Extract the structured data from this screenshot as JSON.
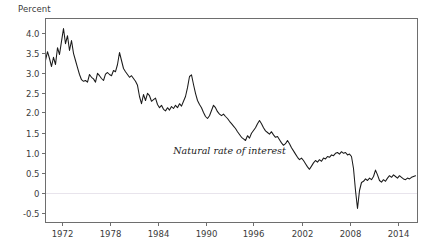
{
  "chart_data": {
    "type": "line",
    "title": "",
    "subtitle": "",
    "ylabel": "Percent",
    "xlabel": "",
    "grid": false,
    "legend": "none",
    "zero_line": true,
    "xlim": [
      1970.0,
      2016.5
    ],
    "ylim": [
      -0.75,
      4.35
    ],
    "ytick_labels": [
      "4.0",
      "3.5",
      "3.0",
      "2.5",
      "2.0",
      "1.5",
      "1.0",
      "0.5",
      "0",
      "-0.5"
    ],
    "ytick_values": [
      4.0,
      3.5,
      3.0,
      2.5,
      2.0,
      1.5,
      1.0,
      0.5,
      0.0,
      -0.5
    ],
    "xtick_labels": [
      "1972",
      "1978",
      "1984",
      "1990",
      "1996",
      "2002",
      "2008",
      "2014"
    ],
    "xtick_values": [
      1972,
      1978,
      1984,
      1990,
      1996,
      2002,
      2008,
      2014
    ],
    "annotations": [
      {
        "text": "Natural rate of interest",
        "x": 1993.0,
        "y": 0.96
      }
    ],
    "series": [
      {
        "name": "Natural rate of interest",
        "color": "#1a1a1a",
        "x": [
          1970.0,
          1970.25,
          1970.5,
          1970.75,
          1971.0,
          1971.25,
          1971.5,
          1971.75,
          1972.0,
          1972.25,
          1972.5,
          1972.75,
          1973.0,
          1973.25,
          1973.5,
          1973.75,
          1974.0,
          1974.25,
          1974.5,
          1974.75,
          1975.0,
          1975.25,
          1975.5,
          1975.75,
          1976.0,
          1976.25,
          1976.5,
          1976.75,
          1977.0,
          1977.25,
          1977.5,
          1977.75,
          1978.0,
          1978.25,
          1978.5,
          1978.75,
          1979.0,
          1979.25,
          1979.5,
          1979.75,
          1980.0,
          1980.25,
          1980.5,
          1980.75,
          1981.0,
          1981.25,
          1981.5,
          1981.75,
          1982.0,
          1982.25,
          1982.5,
          1982.75,
          1983.0,
          1983.25,
          1983.5,
          1983.75,
          1984.0,
          1984.25,
          1984.5,
          1984.75,
          1985.0,
          1985.25,
          1985.5,
          1985.75,
          1986.0,
          1986.25,
          1986.5,
          1986.75,
          1987.0,
          1987.25,
          1987.5,
          1987.75,
          1988.0,
          1988.25,
          1988.5,
          1988.75,
          1989.0,
          1989.25,
          1989.5,
          1989.75,
          1990.0,
          1990.25,
          1990.5,
          1990.75,
          1991.0,
          1991.25,
          1991.5,
          1991.75,
          1992.0,
          1992.25,
          1992.5,
          1992.75,
          1993.0,
          1993.25,
          1993.5,
          1993.75,
          1994.0,
          1994.25,
          1994.5,
          1994.75,
          1995.0,
          1995.25,
          1995.5,
          1995.75,
          1996.0,
          1996.25,
          1996.5,
          1996.75,
          1997.0,
          1997.25,
          1997.5,
          1997.75,
          1998.0,
          1998.25,
          1998.5,
          1998.75,
          1999.0,
          1999.25,
          1999.5,
          1999.75,
          2000.0,
          2000.25,
          2000.5,
          2000.75,
          2001.0,
          2001.25,
          2001.5,
          2001.75,
          2002.0,
          2002.25,
          2002.5,
          2002.75,
          2003.0,
          2003.25,
          2003.5,
          2003.75,
          2004.0,
          2004.25,
          2004.5,
          2004.75,
          2005.0,
          2005.25,
          2005.5,
          2005.75,
          2006.0,
          2006.25,
          2006.5,
          2006.75,
          2007.0,
          2007.25,
          2007.5,
          2007.75,
          2008.0,
          2008.25,
          2008.5,
          2008.75,
          2009.0,
          2009.25,
          2009.5,
          2009.75,
          2010.0,
          2010.25,
          2010.5,
          2010.75,
          2011.0,
          2011.25,
          2011.5,
          2011.75,
          2012.0,
          2012.25,
          2012.5,
          2012.75,
          2013.0,
          2013.25,
          2013.5,
          2013.75,
          2014.0,
          2014.25,
          2014.5,
          2014.75,
          2015.0,
          2015.25,
          2015.5,
          2015.75,
          2016.0,
          2016.25
        ],
        "values": [
          3.3,
          3.52,
          3.35,
          3.15,
          3.38,
          3.2,
          3.62,
          3.45,
          3.78,
          4.1,
          3.72,
          3.92,
          3.55,
          3.8,
          3.48,
          3.3,
          3.12,
          2.95,
          2.82,
          2.78,
          2.8,
          2.76,
          2.95,
          2.88,
          2.84,
          2.76,
          2.98,
          2.92,
          2.85,
          2.8,
          2.96,
          3.0,
          2.95,
          2.92,
          3.05,
          3.02,
          3.2,
          3.5,
          3.3,
          3.1,
          3.02,
          2.95,
          2.88,
          2.92,
          2.85,
          2.78,
          2.68,
          2.4,
          2.22,
          2.45,
          2.3,
          2.48,
          2.42,
          2.28,
          2.32,
          2.36,
          2.2,
          2.12,
          2.18,
          2.08,
          2.04,
          2.12,
          2.06,
          2.15,
          2.1,
          2.18,
          2.12,
          2.22,
          2.16,
          2.28,
          2.4,
          2.62,
          2.9,
          2.94,
          2.7,
          2.48,
          2.3,
          2.2,
          2.12,
          2.0,
          1.9,
          1.85,
          1.92,
          2.05,
          2.18,
          2.12,
          2.02,
          1.96,
          1.92,
          1.96,
          1.9,
          1.85,
          1.78,
          1.72,
          1.66,
          1.6,
          1.52,
          1.45,
          1.38,
          1.34,
          1.3,
          1.42,
          1.36,
          1.48,
          1.55,
          1.62,
          1.72,
          1.8,
          1.72,
          1.62,
          1.54,
          1.5,
          1.46,
          1.52,
          1.44,
          1.38,
          1.4,
          1.32,
          1.24,
          1.18,
          1.22,
          1.3,
          1.22,
          1.12,
          1.04,
          0.96,
          0.88,
          0.82,
          0.86,
          0.8,
          0.72,
          0.64,
          0.58,
          0.66,
          0.74,
          0.8,
          0.76,
          0.82,
          0.78,
          0.86,
          0.84,
          0.9,
          0.88,
          0.94,
          0.92,
          0.98,
          1.0,
          0.96,
          1.02,
          0.98,
          1.0,
          0.94,
          0.96,
          0.9,
          0.6,
          0.05,
          -0.4,
          0.05,
          0.25,
          0.28,
          0.34,
          0.3,
          0.36,
          0.32,
          0.4,
          0.56,
          0.44,
          0.3,
          0.26,
          0.32,
          0.28,
          0.36,
          0.42,
          0.38,
          0.44,
          0.4,
          0.36,
          0.42,
          0.38,
          0.34,
          0.32,
          0.36,
          0.34,
          0.38,
          0.4,
          0.42
        ]
      }
    ]
  }
}
